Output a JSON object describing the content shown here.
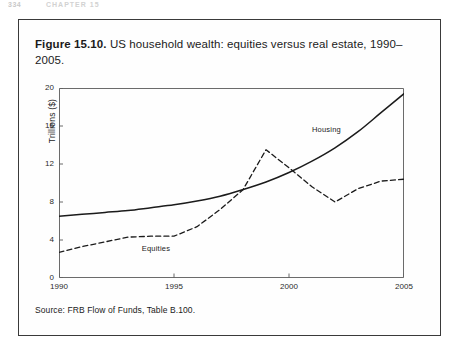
{
  "page_header": {
    "folio": "334",
    "running_head": "CHAPTER 15"
  },
  "figure": {
    "caption_label": "Figure 15.10.",
    "caption_text": " US household wealth: equities versus real estate, 1990–2005.",
    "source_note": "Source: FRB Flow of Funds, Table B.100."
  },
  "chart_data": {
    "type": "line",
    "title": "US household wealth: equities versus real estate, 1990–2005",
    "xlabel": "",
    "ylabel": "Trillions ($)",
    "xlim": [
      1990,
      2005
    ],
    "ylim": [
      0,
      20
    ],
    "grid": false,
    "legend_position": "inline-annotation",
    "x_ticks": [
      "1990",
      "1995",
      "2000",
      "2005"
    ],
    "x_tick_values": [
      1990,
      1995,
      2000,
      2005
    ],
    "y_ticks": [
      "0",
      "4",
      "8",
      "12",
      "16",
      "20"
    ],
    "y_tick_values": [
      0,
      4,
      8,
      12,
      16,
      20
    ],
    "x": [
      1990,
      1991,
      1992,
      1993,
      1994,
      1995,
      1996,
      1997,
      1998,
      1999,
      2000,
      2001,
      2002,
      2003,
      2004,
      2005
    ],
    "series": [
      {
        "name": "Housing",
        "style": "solid",
        "color": "#1b1b1b",
        "values": [
          6.5,
          6.7,
          6.9,
          7.1,
          7.4,
          7.7,
          8.1,
          8.6,
          9.3,
          10.1,
          11.1,
          12.3,
          13.7,
          15.4,
          17.4,
          19.4
        ]
      },
      {
        "name": "Equities",
        "style": "dashed",
        "color": "#1b1b1b",
        "values": [
          2.7,
          3.3,
          3.8,
          4.3,
          4.4,
          4.4,
          5.4,
          7.2,
          9.3,
          13.5,
          11.6,
          9.6,
          8.0,
          9.4,
          10.2,
          10.4
        ]
      }
    ],
    "annotations": [
      {
        "text": "Housing",
        "x": 2001.0,
        "y": 15.6
      },
      {
        "text": "Equities",
        "x": 1993.6,
        "y": 3.1
      }
    ]
  }
}
